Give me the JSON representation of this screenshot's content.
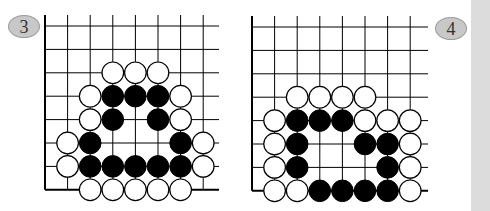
{
  "colors": {
    "line": "#000000",
    "black_stone": "#000000",
    "white_stone": "#ffffff",
    "badge_fill": "#c8c8c8",
    "strip": "#dcdcdc"
  },
  "diagrams": [
    {
      "label": "3",
      "badge": {
        "x": 8,
        "y": 15
      },
      "grid": {
        "x0": 45,
        "y0": 26,
        "dx": 22.6,
        "dy": 23.4,
        "cols": 8,
        "rows": 8,
        "line_top": 15,
        "line_right": 219,
        "edges": [
          "left",
          "bottom"
        ]
      },
      "stones": {
        "white": [
          [
            3,
            2
          ],
          [
            4,
            2
          ],
          [
            5,
            2
          ],
          [
            2,
            3
          ],
          [
            6,
            3
          ],
          [
            2,
            4
          ],
          [
            6,
            4
          ],
          [
            1,
            5
          ],
          [
            7,
            5
          ],
          [
            1,
            6
          ],
          [
            7,
            6
          ],
          [
            2,
            7
          ],
          [
            3,
            7
          ],
          [
            4,
            7
          ],
          [
            5,
            7
          ],
          [
            6,
            7
          ]
        ],
        "black": [
          [
            3,
            3
          ],
          [
            4,
            3
          ],
          [
            5,
            3
          ],
          [
            3,
            4
          ],
          [
            5,
            4
          ],
          [
            2,
            5
          ],
          [
            6,
            5
          ],
          [
            2,
            6
          ],
          [
            3,
            6
          ],
          [
            4,
            6
          ],
          [
            5,
            6
          ],
          [
            6,
            6
          ]
        ]
      }
    },
    {
      "label": "4",
      "badge": {
        "x": 435,
        "y": 17
      },
      "grid": {
        "x0": 252,
        "y0": 27,
        "dx": 22.6,
        "dy": 23.4,
        "cols": 8,
        "rows": 8,
        "line_top": 16,
        "line_right": 428,
        "edges": [
          "left",
          "bottom"
        ]
      },
      "stones": {
        "white": [
          [
            2,
            3
          ],
          [
            3,
            3
          ],
          [
            4,
            3
          ],
          [
            5,
            3
          ],
          [
            1,
            4
          ],
          [
            5,
            4
          ],
          [
            6,
            4
          ],
          [
            7,
            4
          ],
          [
            1,
            5
          ],
          [
            7,
            5
          ],
          [
            1,
            6
          ],
          [
            7,
            6
          ],
          [
            1,
            7
          ],
          [
            2,
            7
          ],
          [
            7,
            7
          ]
        ],
        "black": [
          [
            2,
            4
          ],
          [
            3,
            4
          ],
          [
            4,
            4
          ],
          [
            2,
            5
          ],
          [
            5,
            5
          ],
          [
            6,
            5
          ],
          [
            2,
            6
          ],
          [
            6,
            6
          ],
          [
            3,
            7
          ],
          [
            4,
            7
          ],
          [
            5,
            7
          ],
          [
            6,
            7
          ]
        ]
      }
    }
  ]
}
